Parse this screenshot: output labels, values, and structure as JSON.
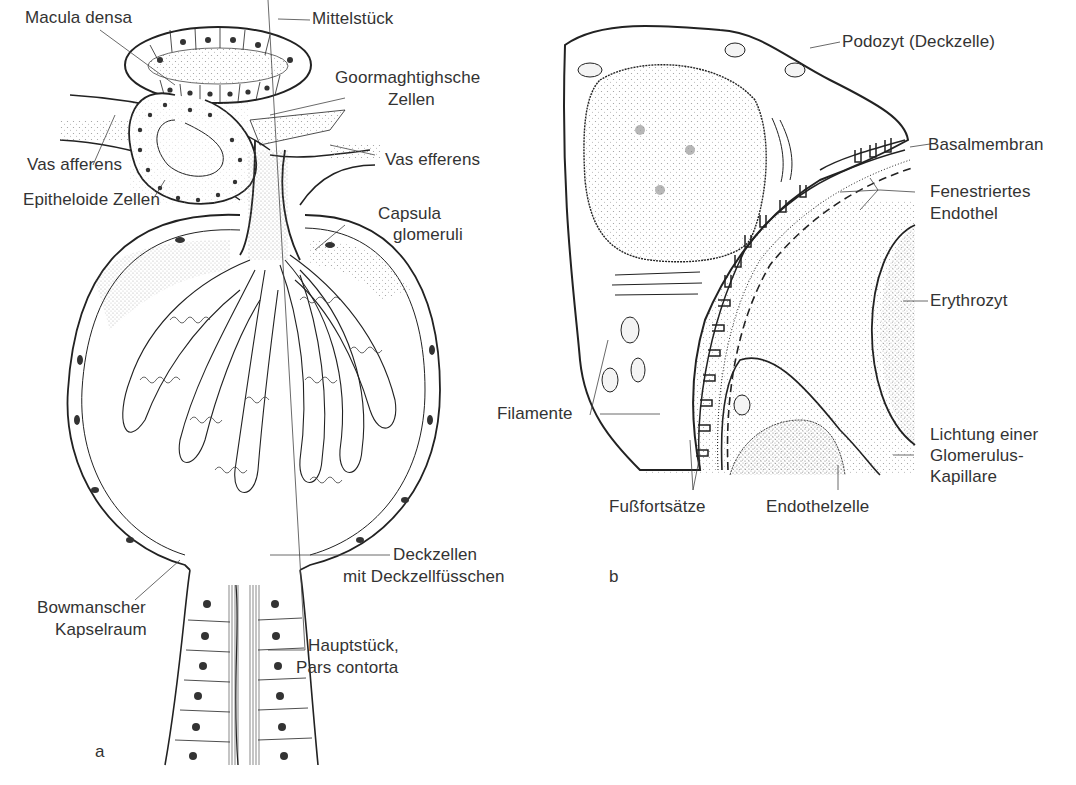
{
  "figure": {
    "panels": [
      {
        "id": "a",
        "letter": "a",
        "subject": "Nierenkörperchen (Glomerulus) mit juxtaglomerulärem Apparat",
        "labels": {
          "macula_densa": "Macula densa",
          "mittelstueck": "Mittelstück",
          "goormaghtigh_1": "Goormaghtighsche",
          "goormaghtigh_2": "Zellen",
          "vas_afferens": "Vas afferens",
          "vas_efferens": "Vas efferens",
          "epitheloide": "Epitheloide Zellen",
          "capsula_1": "Capsula",
          "capsula_2": "glomeruli",
          "deckzellen_1": "Deckzellen",
          "deckzellen_2": "mit Deckzellfüsschen",
          "bowman_1": "Bowmanscher",
          "bowman_2": "Kapselraum",
          "hauptstueck_1": "Hauptstück,",
          "hauptstueck_2": "Pars contorta"
        }
      },
      {
        "id": "b",
        "letter": "b",
        "subject": "Podozyt und Glomeruluskapillare (Ausschnitt)",
        "labels": {
          "podozyt": "Podozyt (Deckzelle)",
          "basalmembran": "Basalmembran",
          "fenestriert_1": "Fenestriertes",
          "fenestriert_2": "Endothel",
          "erythrozyt": "Erythrozyt",
          "filamente": "Filamente",
          "lichtung_1": "Lichtung einer",
          "lichtung_2": "Glomerulus-",
          "lichtung_3": "Kapillare",
          "fussfortsaetze": "Fußfortsätze",
          "endothelzelle": "Endothelzelle"
        }
      }
    ],
    "colors": {
      "ink": "#222222",
      "stipple": "#8a8a8a",
      "background": "#ffffff",
      "label": "#333333"
    }
  }
}
